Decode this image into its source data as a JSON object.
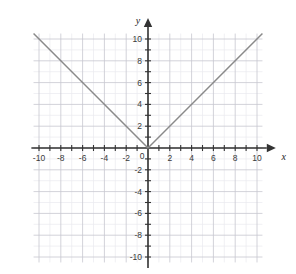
{
  "chart_data": {
    "type": "line",
    "title": "",
    "subtitle": "",
    "xlabel": "x",
    "ylabel": "y",
    "xlim": [
      -10.5,
      10.5
    ],
    "ylim": [
      -10.5,
      10.5
    ],
    "grid": true,
    "minor_grid_step": 1,
    "major_grid_step": 2,
    "legend": null,
    "origin_label": "0",
    "x_tick_labels": [
      "-10",
      "-8",
      "-6",
      "-4",
      "-2",
      "2",
      "4",
      "6",
      "8",
      "10"
    ],
    "x_tick_values": [
      -10,
      -8,
      -6,
      -4,
      -2,
      2,
      4,
      6,
      8,
      10
    ],
    "y_tick_labels": [
      "10",
      "8",
      "6",
      "4",
      "2",
      "-2",
      "-4",
      "-6",
      "-8",
      "-10"
    ],
    "y_tick_values": [
      10,
      8,
      6,
      4,
      2,
      -2,
      -4,
      -6,
      -8,
      -10
    ],
    "x_minor_ticks": [
      -10,
      -9,
      -8,
      -7,
      -6,
      -5,
      -4,
      -3,
      -2,
      -1,
      0,
      1,
      2,
      3,
      4,
      5,
      6,
      7,
      8,
      9,
      10
    ],
    "y_minor_ticks": [
      -10,
      -9,
      -8,
      -7,
      -6,
      -5,
      -4,
      -3,
      -2,
      -1,
      0,
      1,
      2,
      3,
      4,
      5,
      6,
      7,
      8,
      9,
      10
    ],
    "series": [
      {
        "name": "y = |x|",
        "equation": "y = |x|",
        "color": "#8a8a8a",
        "x": [
          -10.5,
          0,
          10.5
        ],
        "values": [
          10.5,
          0,
          10.5
        ],
        "vertex": [
          0,
          0
        ]
      }
    ],
    "axis_color": "#333333",
    "major_grid_color": "#c6c6cf",
    "minor_grid_color": "#e9e9ef",
    "background_color": "#ffffff"
  },
  "figure": {
    "x_axis_name": "x",
    "y_axis_name": "y",
    "origin_label": "0"
  }
}
